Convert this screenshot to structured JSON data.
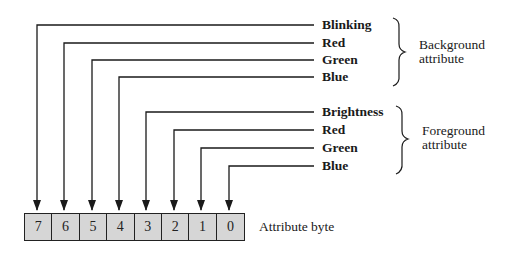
{
  "diagram": {
    "bits": [
      {
        "index": 7,
        "label": "Blinking",
        "group": "background"
      },
      {
        "index": 6,
        "label": "Red",
        "group": "background"
      },
      {
        "index": 5,
        "label": "Green",
        "group": "background"
      },
      {
        "index": 4,
        "label": "Blue",
        "group": "background"
      },
      {
        "index": 3,
        "label": "Brightness",
        "group": "foreground"
      },
      {
        "index": 2,
        "label": "Red",
        "group": "foreground"
      },
      {
        "index": 1,
        "label": "Green",
        "group": "foreground"
      },
      {
        "index": 0,
        "label": "Blue",
        "group": "foreground"
      }
    ],
    "cells": [
      "7",
      "6",
      "5",
      "4",
      "3",
      "2",
      "1",
      "0"
    ],
    "groups": {
      "background": {
        "line1": "Background",
        "line2": "attribute"
      },
      "foreground": {
        "line1": "Foreground",
        "line2": "attribute"
      }
    },
    "byte_label": "Attribute byte",
    "colors": {
      "line": "#1a1a1a",
      "cell_fill": "#d6d6d6",
      "background": "#ffffff"
    }
  }
}
